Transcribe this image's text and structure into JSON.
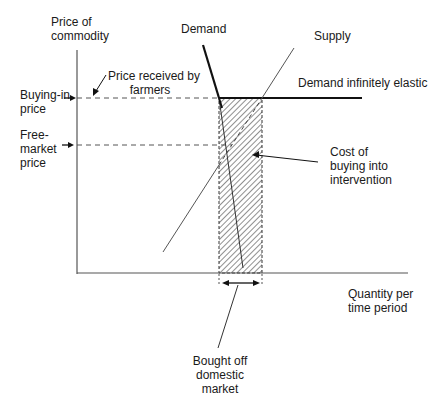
{
  "diagram": {
    "type": "economics-supply-demand",
    "axes": {
      "y_label_line1": "Price of",
      "y_label_line2": "commodity",
      "x_label_line1": "Quantity per",
      "x_label_line2": "time period"
    },
    "price_levels": {
      "buying_in_line1": "Buying-in",
      "buying_in_line2": "price",
      "free_market_line1": "Free-",
      "free_market_line2": "market",
      "free_market_line3": "price"
    },
    "curves": {
      "demand": "Demand",
      "supply": "Supply",
      "demand_elastic": "Demand infinitely elastic"
    },
    "annotations": {
      "price_received_line1": "Price received by",
      "price_received_line2": "farmers",
      "cost_line1": "Cost of",
      "cost_line2": "buying into",
      "cost_line3": "intervention",
      "bought_line1": "Bought off",
      "bought_line2": "domestic",
      "bought_line3": "market"
    },
    "colors": {
      "line": "#1a1a1a",
      "axis": "#555555",
      "dashed": "#555555",
      "hatch": "#333333"
    }
  }
}
